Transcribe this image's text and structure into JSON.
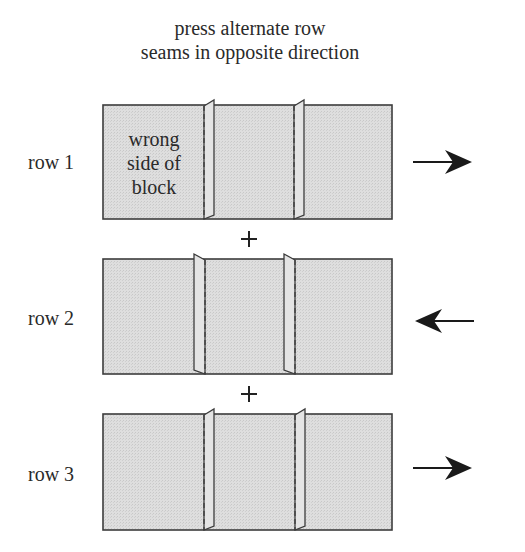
{
  "title": {
    "line1": "press alternate row",
    "line2": "seams in opposite direction"
  },
  "block_note": {
    "line1": "wrong",
    "line2": "side of",
    "line3": "block"
  },
  "rows": [
    {
      "label": "row 1",
      "press_direction": "right",
      "arrow_icon": "arrow-right-icon"
    },
    {
      "label": "row 2",
      "press_direction": "left",
      "arrow_icon": "arrow-left-icon"
    },
    {
      "label": "row 3",
      "press_direction": "right",
      "arrow_icon": "arrow-right-icon"
    }
  ],
  "joiners": [
    "+",
    "+"
  ],
  "colors": {
    "fabric_fill": "#dcdcdc",
    "outline": "#3c3c3c",
    "text": "#2a2a2a"
  }
}
